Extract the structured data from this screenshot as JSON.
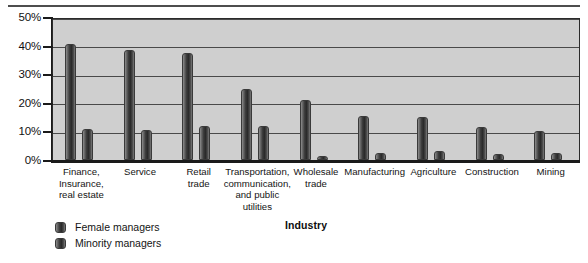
{
  "chart_data": {
    "type": "bar",
    "title": "",
    "xlabel": "Industry",
    "ylabel": "",
    "ylim": [
      0,
      50
    ],
    "ytick_labels": [
      "50%",
      "40%",
      "30%",
      "20%",
      "10%",
      "0%"
    ],
    "ytick_values": [
      50,
      40,
      30,
      20,
      10,
      0
    ],
    "grid": true,
    "legend_position": "bottom-left",
    "categories": [
      "Finance, Insurance, real estate",
      "Service",
      "Retail trade",
      "Transportation, communication, and public utilities",
      "Wholesale trade",
      "Manufacturing",
      "Agriculture",
      "Construction",
      "Mining"
    ],
    "category_lines": [
      [
        "Finance,",
        "Insurance,",
        "real estate"
      ],
      [
        "Service"
      ],
      [
        "Retail",
        "trade"
      ],
      [
        "Transportation,",
        "communication,",
        "and public",
        "utilities"
      ],
      [
        "Wholesale",
        "trade"
      ],
      [
        "Manufacturing"
      ],
      [
        "Agriculture"
      ],
      [
        "Construction"
      ],
      [
        "Mining"
      ]
    ],
    "series": [
      {
        "name": "Female managers",
        "values": [
          40.5,
          38.5,
          37.5,
          25.0,
          21.0,
          15.5,
          15.0,
          11.5,
          10.0
        ]
      },
      {
        "name": "Minority managers",
        "values": [
          11.0,
          10.5,
          12.0,
          12.0,
          1.5,
          2.5,
          3.0,
          2.0,
          2.5
        ]
      }
    ]
  },
  "legend": {
    "items": [
      {
        "label": "Female managers"
      },
      {
        "label": "Minority managers"
      }
    ]
  },
  "axis": {
    "x_title": "Industry"
  }
}
